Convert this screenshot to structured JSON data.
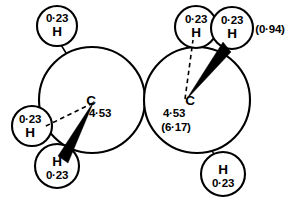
{
  "figure": {
    "background_color": "#ffffff",
    "stroke_color": "#000000"
  },
  "annotations": {
    "bracket_value": "(0·94)"
  },
  "atoms": [
    {
      "id": "h-top-left",
      "element": "H",
      "charge": "0·23",
      "label_order": "charge-above",
      "cx": 57,
      "cy": 26,
      "r": 20
    },
    {
      "id": "h-left",
      "element": "H",
      "charge": "0·23",
      "label_order": "charge-above",
      "cx": 32,
      "cy": 126,
      "r": 20
    },
    {
      "id": "h-bottom-left",
      "element": "H",
      "charge": "0·23",
      "label_order": "element-above",
      "cx": 57,
      "cy": 166,
      "r": 22
    },
    {
      "id": "c-left",
      "element": "C",
      "charge": "4·53",
      "charge_alt": null,
      "cx": 92,
      "cy": 100,
      "r": 53
    },
    {
      "id": "c-right",
      "element": "C",
      "charge": "4·53",
      "charge_alt": "(6·17)",
      "cx": 197,
      "cy": 100,
      "r": 53
    },
    {
      "id": "h-top-mid-right",
      "element": "H",
      "charge": "0·23",
      "label_order": "charge-above",
      "cx": 196,
      "cy": 27,
      "r": 21
    },
    {
      "id": "h-top-right",
      "element": "H",
      "charge": "0·23",
      "label_order": "charge-above",
      "cx": 232,
      "cy": 28,
      "r": 21
    },
    {
      "id": "h-bottom-right",
      "element": "H",
      "charge": "0·23",
      "label_order": "element-above",
      "cx": 223,
      "cy": 174,
      "r": 22
    }
  ],
  "bonds": [
    {
      "id": "bond-cleft-htopleft",
      "type": "plain",
      "from": "c-left",
      "to": "h-top-left"
    },
    {
      "id": "bond-cleft-hleft",
      "type": "dashed",
      "from": "c-left",
      "to": "h-left"
    },
    {
      "id": "bond-cleft-hbottomleft",
      "type": "wedge",
      "from": "c-left",
      "to": "h-bottom-left"
    },
    {
      "id": "bond-cleft-cright",
      "type": "single",
      "from": "c-left",
      "to": "c-right"
    },
    {
      "id": "bond-cright-htopmid",
      "type": "dashed",
      "from": "c-right",
      "to": "h-top-mid-right"
    },
    {
      "id": "bond-cright-htopright",
      "type": "wedge",
      "from": "c-right",
      "to": "h-top-right"
    },
    {
      "id": "bond-cright-hbottomright",
      "type": "plain",
      "from": "c-right",
      "to": "h-bottom-right"
    }
  ]
}
